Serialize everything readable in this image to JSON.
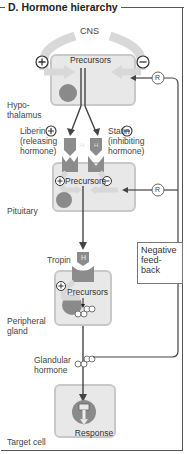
{
  "title": "D. Hormone hierarchy",
  "labels": {
    "cns": "CNS",
    "hypothalamus": "Hypo-\nthalamus",
    "pituitary": "Pituitary",
    "peripheral_gland": "Peripheral\ngland",
    "target_cell": "Target cell",
    "liberin": "Liberin\n(releasing\nhormone)",
    "statin": "Statin\n(inhibiting\nhormone)",
    "tropin": "Tropin",
    "glandular_hormone": "Glandular\nhormone",
    "negative_feedback": "Negative\nfeed-\nback",
    "precursors": "Precursors",
    "response": "Response",
    "receptor": "R",
    "hormone_glyph": "H",
    "plus": "+",
    "minus": "−"
  },
  "colors": {
    "cell_fill": "#e8e8e8",
    "cell_border": "#c8c8c8",
    "nucleus": "#8a8a8a",
    "hormone": "#8c8c8c",
    "arrow_gray": "#d8d8d8",
    "line": "#444444",
    "frame": "#555555"
  }
}
